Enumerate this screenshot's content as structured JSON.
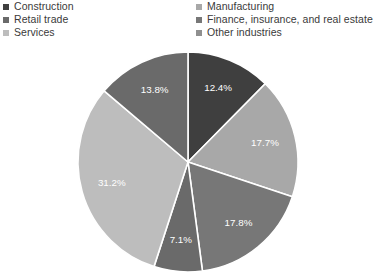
{
  "legend": {
    "left_column": [
      {
        "label": "Construction",
        "color": "#3f3f3f",
        "marker": "square-marker"
      },
      {
        "label": "Retail trade",
        "color": "#6a6a6a",
        "marker": "square-marker"
      },
      {
        "label": "Services",
        "color": "#bdbdbd",
        "marker": "square-marker"
      }
    ],
    "right_column": [
      {
        "label": "Manufacturing",
        "color": "#a8a8a8",
        "marker": "square-marker"
      },
      {
        "label": "Finance, insurance, and real estate",
        "color": "#777777",
        "marker": "square-marker"
      },
      {
        "label": "Other industries",
        "color": "#8f8f8f",
        "marker": "square-marker"
      }
    ]
  },
  "chart_data": {
    "type": "pie",
    "title": "",
    "subtitle": "",
    "xlabel": "",
    "ylabel": "",
    "grid": false,
    "legend_position": "top",
    "start_angle_deg": 0,
    "direction": "clockwise",
    "labels_inside": true,
    "label_suffix": "%",
    "categories": [
      "Construction",
      "Manufacturing",
      "Finance, insurance, and real estate",
      "Retail trade",
      "Services",
      "Other industries"
    ],
    "values": [
      12.4,
      17.7,
      17.8,
      7.1,
      31.2,
      13.8
    ],
    "value_labels": [
      "12.4%",
      "17.7%",
      "17.8%",
      "7.1%",
      "31.2%",
      "13.8%"
    ],
    "colors": [
      "#3f3f3f",
      "#a8a8a8",
      "#777777",
      "#6a6a6a",
      "#bdbdbd",
      "#6a6a6a"
    ],
    "slice_separator_color": "#ffffff",
    "label_text_color": "#ffffff"
  },
  "geometry": {
    "center_x": 188,
    "center_y": 162,
    "radius": 110,
    "label_radius_ratio": 0.72
  }
}
